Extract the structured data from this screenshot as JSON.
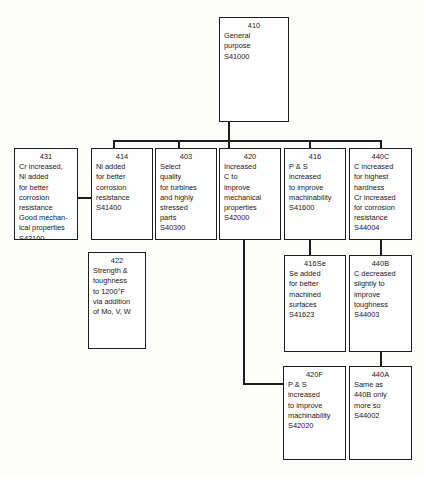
{
  "diagram": {
    "type": "tree-flowchart",
    "line_color": "#1d1d1d",
    "background_color": "#fdfdfc",
    "box_fill": "#fefefe"
  },
  "nodes": {
    "n410": {
      "code": "410",
      "desc": "General\npurpose\nS41000"
    },
    "n431": {
      "code": "431",
      "desc": "Cr increased,\nNi added\nfor better\ncorrosion\nresistance\nGood mechan-\nical properties\nS43100"
    },
    "n414": {
      "code": "414",
      "desc": "Ni added\nfor better\ncorrosion\nresistance\nS41400"
    },
    "n403": {
      "code": "403",
      "desc": "Select\nquality\nfor turbines\nand highly\nstressed\nparts\nS40300"
    },
    "n420": {
      "code": "420",
      "desc": "Increased\nC to\nimprove\nmechanical\nproperties\nS42000"
    },
    "n416": {
      "code": "416",
      "desc": "P & S\nincreased\nto improve\nmachinability\nS41600"
    },
    "n440c": {
      "code": "440C",
      "desc": "C increased\nfor highest\nhardness\nCr increased\nfor corrosion\nresistance\nS44004"
    },
    "n422": {
      "code": "422",
      "desc": "Strength &\ntoughness\nto 1200°F\nvia addition\nof Mo, V, W"
    },
    "n416se": {
      "code": "416Se",
      "desc": "Se added\nfor better\nmachined\nsurfaces\nS41623"
    },
    "n440b": {
      "code": "440B",
      "desc": "C decreased\nslightly to\nimprove\ntoughness\nS44003"
    },
    "n420f": {
      "code": "420F",
      "desc": "P & S\nincreased\nto improve\nmachinability\nS42020"
    },
    "n440a": {
      "code": "440A",
      "desc": "Same as\n440B only\nmore so\nS44002"
    }
  },
  "edges": [
    {
      "from": "410",
      "to": "414"
    },
    {
      "from": "410",
      "to": "403"
    },
    {
      "from": "410",
      "to": "420"
    },
    {
      "from": "410",
      "to": "416"
    },
    {
      "from": "410",
      "to": "440C"
    },
    {
      "from": "414",
      "to": "431"
    },
    {
      "from": "416",
      "to": "416Se"
    },
    {
      "from": "440C",
      "to": "440B"
    },
    {
      "from": "440B",
      "to": "440A"
    },
    {
      "from": "420",
      "to": "420F"
    }
  ]
}
